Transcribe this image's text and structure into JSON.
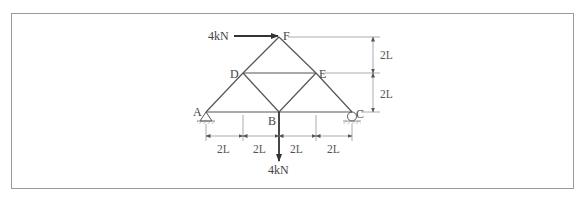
{
  "figure": {
    "type": "truss",
    "nodes": {
      "A": {
        "label": "A",
        "support": "pin"
      },
      "B": {
        "label": "B"
      },
      "C": {
        "label": "C",
        "support": "roller"
      },
      "D": {
        "label": "D"
      },
      "E": {
        "label": "E"
      },
      "F": {
        "label": "F"
      }
    },
    "members": [
      "A-B",
      "B-C",
      "A-D",
      "D-F",
      "F-E",
      "E-C",
      "D-E",
      "D-B",
      "B-E"
    ],
    "loads": {
      "horizontal": {
        "label": "4kN",
        "node": "F",
        "direction": "right"
      },
      "vertical": {
        "label": "4kN",
        "node": "B",
        "direction": "down"
      }
    },
    "dimensions": {
      "horizontal": [
        "2L",
        "2L",
        "2L",
        "2L"
      ],
      "vertical": [
        "2L",
        "2L"
      ]
    }
  }
}
